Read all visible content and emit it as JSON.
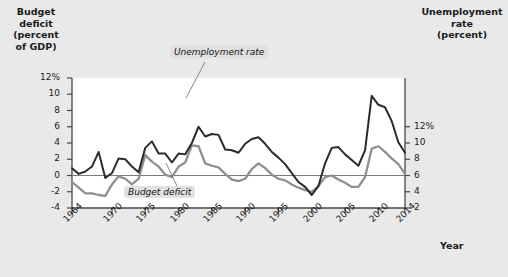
{
  "figure": {
    "background_color": "#e9e9e9",
    "plot_background_color": "#ffffff",
    "left_axis_title": "Budget\ndeficit\n(percent\nof GDP)",
    "right_axis_title": "Unemployment\nrate\n(percent)",
    "xlabel": "Year"
  },
  "annotations": [
    {
      "name": "unemployment-rate-annotation",
      "text": "Unemployment rate"
    },
    {
      "name": "budget-deficit-annotation",
      "text": "Budget deficit"
    }
  ],
  "chart_data": {
    "type": "line",
    "title": "",
    "xlabel": "Year",
    "ylabel": "Budget deficit (percent of GDP)",
    "y2label": "Unemployment rate (percent)",
    "grid": false,
    "legend": "annotated-inline",
    "xlim": [
      1964,
      2014
    ],
    "ylim": [
      -4,
      12
    ],
    "y2lim": [
      2,
      18
    ],
    "yticks": [
      "12%",
      "10",
      "8",
      "6",
      "4",
      "2",
      "0",
      "-2",
      "-4"
    ],
    "ytick_values": [
      12,
      10,
      8,
      6,
      4,
      2,
      0,
      -2,
      -4
    ],
    "y2ticks": [
      "12%",
      "10",
      "8",
      "6",
      "4",
      "2"
    ],
    "y2tick_values": [
      12,
      10,
      8,
      6,
      4,
      2
    ],
    "xticks": [
      "1964",
      "1970",
      "1975",
      "1980",
      "1985",
      "1990",
      "1995",
      "2000",
      "2005",
      "2010",
      "2014"
    ],
    "xtick_values": [
      1964,
      1970,
      1975,
      1980,
      1985,
      1990,
      1995,
      2000,
      2005,
      2010,
      2014
    ],
    "zero_line": 0,
    "x": [
      1964,
      1965,
      1966,
      1967,
      1968,
      1969,
      1970,
      1971,
      1972,
      1973,
      1974,
      1975,
      1976,
      1977,
      1978,
      1979,
      1980,
      1981,
      1982,
      1983,
      1984,
      1985,
      1986,
      1987,
      1988,
      1989,
      1990,
      1991,
      1992,
      1993,
      1994,
      1995,
      1996,
      1997,
      1998,
      1999,
      2000,
      2001,
      2002,
      2003,
      2004,
      2005,
      2006,
      2007,
      2008,
      2009,
      2010,
      2011,
      2012,
      2013,
      2014
    ],
    "series": [
      {
        "name": "Budget deficit",
        "color": "#2b2b2b",
        "axis": "left",
        "unit": "percent of GDP",
        "values": [
          0.9,
          0.2,
          0.5,
          1.1,
          2.9,
          -0.3,
          0.3,
          2.1,
          2.0,
          1.1,
          0.4,
          3.4,
          4.2,
          2.7,
          2.7,
          1.6,
          2.7,
          2.6,
          4.0,
          6.0,
          4.8,
          5.1,
          5.0,
          3.2,
          3.1,
          2.8,
          3.9,
          4.5,
          4.7,
          3.9,
          2.9,
          2.2,
          1.4,
          0.3,
          -0.8,
          -1.4,
          -2.4,
          -1.3,
          1.5,
          3.4,
          3.5,
          2.6,
          1.9,
          1.2,
          3.1,
          9.8,
          8.7,
          8.4,
          6.7,
          4.1,
          2.8
        ]
      },
      {
        "name": "Unemployment rate",
        "color": "#8f8f8f",
        "axis": "right",
        "unit": "percent",
        "values": [
          5.2,
          4.5,
          3.8,
          3.8,
          3.6,
          3.5,
          4.9,
          5.9,
          5.6,
          4.9,
          5.6,
          8.5,
          7.7,
          7.1,
          6.1,
          5.8,
          7.1,
          7.6,
          9.7,
          9.6,
          7.5,
          7.2,
          7.0,
          6.2,
          5.5,
          5.3,
          5.6,
          6.8,
          7.5,
          6.9,
          6.1,
          5.6,
          5.4,
          4.9,
          4.5,
          4.2,
          4.0,
          4.7,
          5.8,
          6.0,
          5.5,
          5.1,
          4.6,
          4.6,
          5.8,
          9.3,
          9.6,
          8.9,
          8.1,
          7.4,
          6.2
        ]
      }
    ]
  }
}
